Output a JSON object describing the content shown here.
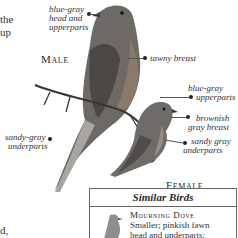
{
  "left_fragments": [
    "the",
    "up",
    "d,"
  ],
  "labels": {
    "male": "Male",
    "female": "Female",
    "male_head": [
      "blue-gray",
      "head and",
      "upperparts"
    ],
    "tawny_breast": "tawny breast",
    "female_upper": [
      "blue-gray",
      "upperparts"
    ],
    "female_breast": [
      "brownish",
      "gray breast"
    ],
    "female_under": [
      "sandy gray",
      "underparts"
    ],
    "male_under": [
      "sandy-gray",
      "underparts"
    ]
  },
  "similar_birds": {
    "title": "Similar Birds",
    "species": "Mourning Dove",
    "description": [
      "Smaller; pinkish fawn",
      "head and underparts;"
    ]
  }
}
